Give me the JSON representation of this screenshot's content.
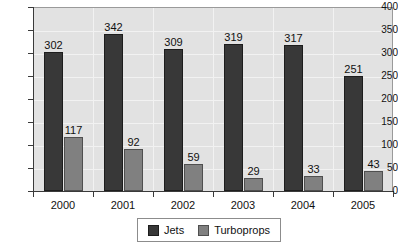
{
  "chart_data": {
    "type": "bar",
    "title": "",
    "xlabel": "",
    "ylabel": "",
    "categories": [
      "2000",
      "2001",
      "2002",
      "2003",
      "2004",
      "2005"
    ],
    "series": [
      {
        "name": "Jets",
        "color": "#383838",
        "values": [
          302,
          342,
          309,
          319,
          317,
          251
        ]
      },
      {
        "name": "Turboprops",
        "color": "#808080",
        "values": [
          117,
          92,
          59,
          29,
          33,
          43
        ]
      }
    ],
    "ylim": [
      0,
      400
    ],
    "ytick_step": 50,
    "yticks": [
      "0",
      "50",
      "100",
      "150",
      "200",
      "250",
      "300",
      "350",
      "400"
    ],
    "grid": true,
    "data_labels": true,
    "legend_position": "bottom",
    "plot_background": "#e2e2e2"
  },
  "legend": {
    "entries": [
      {
        "label": "Jets"
      },
      {
        "label": "Turboprops"
      }
    ]
  }
}
